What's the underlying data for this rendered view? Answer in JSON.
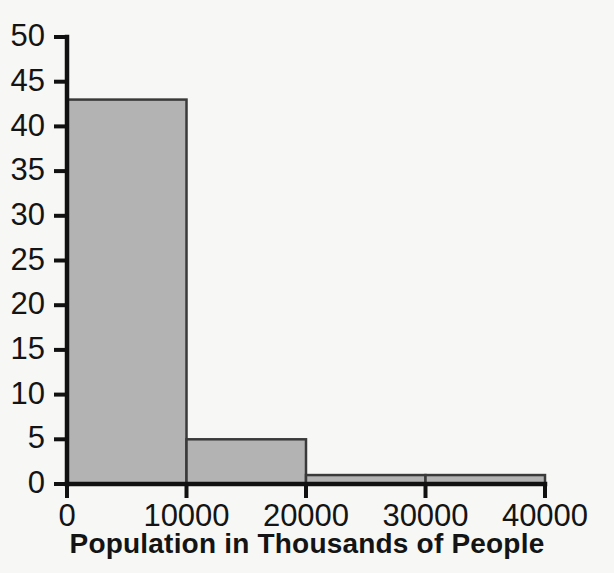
{
  "chart_data": {
    "type": "bar",
    "title": "",
    "xlabel": "Population in Thousands of People",
    "ylabel": "",
    "categories": [
      "0-10000",
      "10000-20000",
      "20000-30000",
      "30000-40000"
    ],
    "bin_edges": [
      0,
      10000,
      20000,
      30000,
      40000
    ],
    "values": [
      43,
      5,
      1,
      1
    ],
    "xlim": [
      0,
      40000
    ],
    "ylim": [
      0,
      50
    ],
    "xticks": [
      0,
      10000,
      20000,
      30000,
      40000
    ],
    "xtick_labels": [
      "0",
      "10000",
      "20000",
      "30000",
      "40000"
    ],
    "yticks": [
      0,
      5,
      10,
      15,
      20,
      25,
      30,
      35,
      40,
      45,
      50
    ],
    "ytick_labels": [
      "0",
      "5",
      "10",
      "15",
      "20",
      "25",
      "30",
      "35",
      "40",
      "45",
      "50"
    ],
    "grid": false,
    "legend": false,
    "legend_position": "none",
    "bar_fill_color": "#b3b3b3",
    "bar_edge_color": "#3a3a3a",
    "axis_color": "#111111",
    "background_color": "#f7f7f5",
    "text_color": "#141414"
  },
  "labels": {
    "clipped_top_text": "",
    "x_axis_title": "Population in Thousands of People"
  }
}
